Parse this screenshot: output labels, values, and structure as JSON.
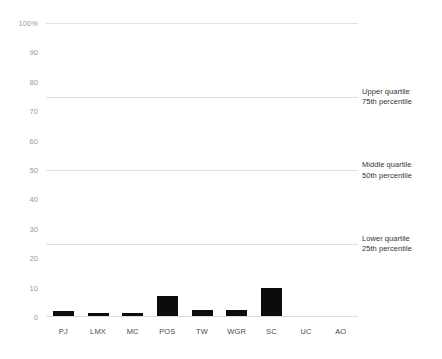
{
  "chart_data": {
    "type": "bar",
    "title": "",
    "xlabel": "",
    "ylabel": "",
    "ylim": [
      0,
      100
    ],
    "grid": false,
    "legend_position": "right",
    "categories": [
      "PJ",
      "LMX",
      "MC",
      "POS",
      "TW",
      "WGR",
      "SC",
      "UC",
      "AO"
    ],
    "values": [
      2.2,
      1.4,
      1.5,
      7.0,
      2.3,
      2.3,
      10.0,
      0.3,
      0.3
    ],
    "y_ticks": [
      {
        "value": 100,
        "label": "100%"
      },
      {
        "value": 90,
        "label": "90"
      },
      {
        "value": 80,
        "label": "80"
      },
      {
        "value": 70,
        "label": "70"
      },
      {
        "value": 60,
        "label": "60"
      },
      {
        "value": 50,
        "label": "50"
      },
      {
        "value": 40,
        "label": "40"
      },
      {
        "value": 30,
        "label": "30"
      },
      {
        "value": 20,
        "label": "20"
      },
      {
        "value": 10,
        "label": "10"
      },
      {
        "value": 0,
        "label": "0"
      }
    ],
    "reference_lines": [
      {
        "value": 75,
        "label_top": "Upper quartile",
        "label_bottom": "75th percentile"
      },
      {
        "value": 50,
        "label_top": "Middle quartile",
        "label_bottom": "50th percentile"
      },
      {
        "value": 25,
        "label_top": "Lower quartile",
        "label_bottom": "25th percentile"
      }
    ],
    "colors": {
      "bar": "#0c0c0c",
      "reference_line": "#e0e0e0",
      "axis_text": "#9a9a9a",
      "annotation_text": "#353535",
      "background": "#ffffff"
    }
  }
}
